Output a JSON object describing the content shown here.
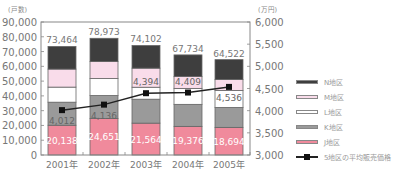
{
  "chart_data": {
    "type": "bar",
    "stacked": true,
    "categories": [
      "2001年",
      "2002年",
      "2003年",
      "2004年",
      "2005年"
    ],
    "left_axis": {
      "unit_label": "(戸数)",
      "ylim": [
        0,
        90000
      ],
      "ticks": [
        "0",
        "10,000",
        "20,000",
        "30,000",
        "40,000",
        "50,000",
        "60,000",
        "70,000",
        "80,000",
        "90,000"
      ]
    },
    "right_axis": {
      "unit_label": "(万円)",
      "ylim": [
        3000,
        6000
      ],
      "ticks": [
        "3,000",
        "3,500",
        "4,000",
        "4,500",
        "5,000",
        "5,500",
        "6,000"
      ]
    },
    "series": [
      {
        "name": "J地区",
        "color": "#f08a9c",
        "values": [
          20138,
          24651,
          21564,
          19376,
          18694
        ]
      },
      {
        "name": "K地区",
        "color": "#9a9a9a",
        "values": [
          15600,
          15600,
          16200,
          14900,
          13500
        ]
      },
      {
        "name": "L地区",
        "color": "#ffffff",
        "values": [
          10200,
          11500,
          8100,
          10800,
          11500
        ]
      },
      {
        "name": "M地区",
        "color": "#f9dcea",
        "values": [
          12200,
          11500,
          12900,
          8100,
          7400
        ]
      },
      {
        "name": "N地区",
        "color": "#3e3e3e",
        "values": [
          15326,
          15722,
          15338,
          14558,
          13428
        ]
      }
    ],
    "totals": [
      73464,
      78973,
      74102,
      67734,
      64522
    ],
    "total_labels": [
      "73,464",
      "78,973",
      "74,102",
      "67,734",
      "64,522"
    ],
    "j_labels": [
      "20,138",
      "24,651",
      "21,564",
      "19,376",
      "18,694"
    ],
    "line_series": {
      "name": "5地区の平均販売価格",
      "axis": "right",
      "color": "#222222",
      "values": [
        4012,
        4136,
        4394,
        4409,
        4536
      ],
      "labels": [
        "4,012",
        "4,136",
        "4,394",
        "4,409",
        "4,536"
      ]
    },
    "legend": {
      "position": "right",
      "items": [
        "N地区",
        "M地区",
        "L地区",
        "K地区",
        "J地区",
        "5地区の平均販売価格"
      ]
    },
    "grid": false
  }
}
